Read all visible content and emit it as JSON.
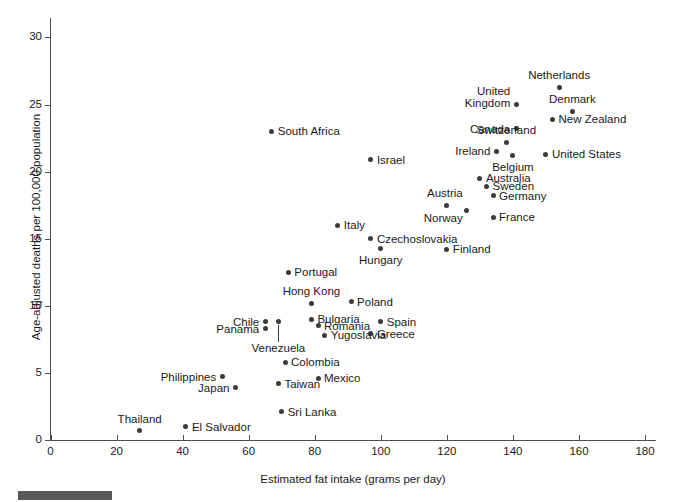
{
  "chart_data": {
    "type": "scatter",
    "title": "",
    "xlabel": "Estimated fat intake (grams per day)",
    "ylabel": "Age-adjusted deaths per 100,000 population",
    "xlim": [
      0,
      183
    ],
    "ylim": [
      0,
      31.5
    ],
    "xticks": [
      0,
      20,
      40,
      60,
      80,
      100,
      120,
      140,
      160,
      180
    ],
    "yticks": [
      0,
      5,
      10,
      15,
      20,
      25,
      30
    ],
    "grid": false,
    "legend": "none",
    "points": [
      {
        "label": "Netherlands",
        "x": 154,
        "y": 26.3,
        "label_pos": "above"
      },
      {
        "label": "United Kingdom",
        "x": 141,
        "y": 25.0,
        "label_pos": "above-left-2line"
      },
      {
        "label": "Denmark",
        "x": 158,
        "y": 24.5,
        "label_pos": "above"
      },
      {
        "label": "New Zealand",
        "x": 152,
        "y": 23.9,
        "label_pos": "right"
      },
      {
        "label": "Canada",
        "x": 141,
        "y": 23.2,
        "label_pos": "left"
      },
      {
        "label": "Switzerland",
        "x": 138,
        "y": 22.2,
        "label_pos": "above"
      },
      {
        "label": "Ireland",
        "x": 135,
        "y": 21.5,
        "label_pos": "left"
      },
      {
        "label": "Belgium",
        "x": 140,
        "y": 21.2,
        "label_pos": "below"
      },
      {
        "label": "United States",
        "x": 150,
        "y": 21.3,
        "label_pos": "right"
      },
      {
        "label": "South Africa",
        "x": 67,
        "y": 23.0,
        "label_pos": "right"
      },
      {
        "label": "Israel",
        "x": 97,
        "y": 20.9,
        "label_pos": "right"
      },
      {
        "label": "Australia",
        "x": 130,
        "y": 19.5,
        "label_pos": "right"
      },
      {
        "label": "Sweden",
        "x": 132,
        "y": 18.9,
        "label_pos": "right"
      },
      {
        "label": "Germany",
        "x": 134,
        "y": 18.2,
        "label_pos": "right"
      },
      {
        "label": "Austria",
        "x": 120,
        "y": 17.5,
        "label_pos": "above-left"
      },
      {
        "label": "Norway",
        "x": 126,
        "y": 17.1,
        "label_pos": "below-left"
      },
      {
        "label": "France",
        "x": 134,
        "y": 16.6,
        "label_pos": "right"
      },
      {
        "label": "Italy",
        "x": 87,
        "y": 16.0,
        "label_pos": "right"
      },
      {
        "label": "Czechoslovakia",
        "x": 97,
        "y": 15.0,
        "label_pos": "right"
      },
      {
        "label": "Hungary",
        "x": 100,
        "y": 14.3,
        "label_pos": "below"
      },
      {
        "label": "Finland",
        "x": 120,
        "y": 14.2,
        "label_pos": "right"
      },
      {
        "label": "Portugal",
        "x": 72,
        "y": 12.5,
        "label_pos": "right"
      },
      {
        "label": "Hong Kong",
        "x": 79,
        "y": 10.2,
        "label_pos": "above"
      },
      {
        "label": "Poland",
        "x": 91,
        "y": 10.3,
        "label_pos": "right"
      },
      {
        "label": "Chile",
        "x": 65,
        "y": 8.8,
        "label_pos": "left"
      },
      {
        "label": "Bulgaria",
        "x": 79,
        "y": 9.0,
        "label_pos": "right"
      },
      {
        "label": "Venezuela",
        "x": 69,
        "y": 8.8,
        "label_pos": "leader-below"
      },
      {
        "label": "Romania",
        "x": 81,
        "y": 8.5,
        "label_pos": "right"
      },
      {
        "label": "Panama",
        "x": 65,
        "y": 8.3,
        "label_pos": "left"
      },
      {
        "label": "Spain",
        "x": 100,
        "y": 8.8,
        "label_pos": "right"
      },
      {
        "label": "Greece",
        "x": 97,
        "y": 7.9,
        "label_pos": "right"
      },
      {
        "label": "Yugoslavia",
        "x": 83,
        "y": 7.8,
        "label_pos": "right"
      },
      {
        "label": "Colombia",
        "x": 71,
        "y": 5.8,
        "label_pos": "right"
      },
      {
        "label": "Philippines",
        "x": 52,
        "y": 4.7,
        "label_pos": "left"
      },
      {
        "label": "Mexico",
        "x": 81,
        "y": 4.6,
        "label_pos": "right"
      },
      {
        "label": "Taiwan",
        "x": 69,
        "y": 4.2,
        "label_pos": "right"
      },
      {
        "label": "Japan",
        "x": 56,
        "y": 3.9,
        "label_pos": "left"
      },
      {
        "label": "Sri Lanka",
        "x": 70,
        "y": 2.1,
        "label_pos": "right"
      },
      {
        "label": "Thailand",
        "x": 27,
        "y": 0.7,
        "label_pos": "above"
      },
      {
        "label": "El Salvador",
        "x": 41,
        "y": 1.0,
        "label_pos": "right"
      }
    ]
  },
  "colors": {
    "point": "#3a3a3a",
    "axis": "#4d4d4d",
    "text": "#1a1a1a",
    "footer_bar": "#59595b",
    "background": "#ffffff"
  }
}
